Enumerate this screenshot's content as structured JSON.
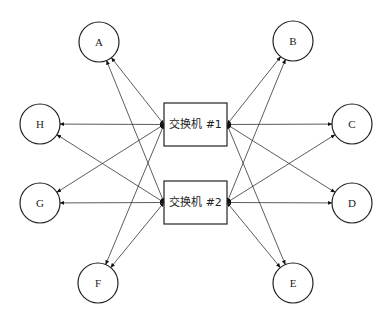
{
  "diagram": {
    "type": "network-topology",
    "switches": [
      {
        "id": "sw1",
        "label": "交换机 #1",
        "x": 164,
        "y": 103,
        "w": 63,
        "h": 43
      },
      {
        "id": "sw2",
        "label": "交换机 #2",
        "x": 164,
        "y": 181,
        "w": 63,
        "h": 43
      }
    ],
    "nodes": [
      {
        "id": "A",
        "label": "A",
        "cx": 99,
        "cy": 42,
        "r": 20,
        "side": "left"
      },
      {
        "id": "B",
        "label": "B",
        "cx": 293,
        "cy": 41,
        "r": 20,
        "side": "right"
      },
      {
        "id": "C",
        "label": "C",
        "cx": 352,
        "cy": 124,
        "r": 20,
        "side": "right"
      },
      {
        "id": "D",
        "label": "D",
        "cx": 352,
        "cy": 203,
        "r": 20,
        "side": "right"
      },
      {
        "id": "E",
        "label": "E",
        "cx": 293,
        "cy": 283,
        "r": 20,
        "side": "right"
      },
      {
        "id": "F",
        "label": "F",
        "cx": 98,
        "cy": 283,
        "r": 20,
        "side": "left"
      },
      {
        "id": "G",
        "label": "G",
        "cx": 40,
        "cy": 203,
        "r": 20,
        "side": "left"
      },
      {
        "id": "H",
        "label": "H",
        "cx": 40,
        "cy": 124,
        "r": 20,
        "side": "left"
      }
    ],
    "edges_note": "Each switch has a bidirectional link to every node A–H",
    "edges": [
      {
        "from": "sw1",
        "to": "A",
        "bidirectional": true
      },
      {
        "from": "sw1",
        "to": "B",
        "bidirectional": true
      },
      {
        "from": "sw1",
        "to": "C",
        "bidirectional": true
      },
      {
        "from": "sw1",
        "to": "D",
        "bidirectional": true
      },
      {
        "from": "sw1",
        "to": "E",
        "bidirectional": true
      },
      {
        "from": "sw1",
        "to": "F",
        "bidirectional": true
      },
      {
        "from": "sw1",
        "to": "G",
        "bidirectional": true
      },
      {
        "from": "sw1",
        "to": "H",
        "bidirectional": true
      },
      {
        "from": "sw2",
        "to": "A",
        "bidirectional": true
      },
      {
        "from": "sw2",
        "to": "B",
        "bidirectional": true
      },
      {
        "from": "sw2",
        "to": "C",
        "bidirectional": true
      },
      {
        "from": "sw2",
        "to": "D",
        "bidirectional": true
      },
      {
        "from": "sw2",
        "to": "E",
        "bidirectional": true
      },
      {
        "from": "sw2",
        "to": "F",
        "bidirectional": true
      },
      {
        "from": "sw2",
        "to": "G",
        "bidirectional": true
      },
      {
        "from": "sw2",
        "to": "H",
        "bidirectional": true
      }
    ],
    "colors": {
      "stroke": "#222222",
      "background": "#ffffff"
    }
  }
}
